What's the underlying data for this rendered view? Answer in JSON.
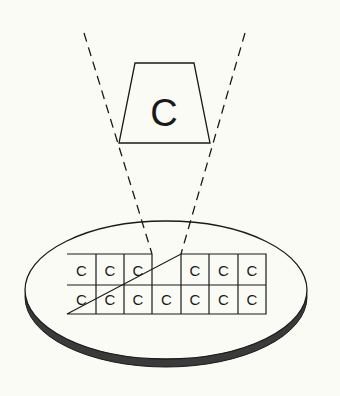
{
  "diagram": {
    "colors": {
      "background": "#fbfbf6",
      "stroke": "#1a1a1a",
      "plate_face": "#fbfbf6",
      "plate_edge": "#3a3a3a"
    },
    "picked_die": {
      "label": "C"
    },
    "grid": {
      "rows": 2,
      "cols": 7,
      "row_1": [
        "C",
        "C",
        "C",
        "",
        "C",
        "C",
        "C"
      ],
      "row_2": [
        "C",
        "C",
        "C",
        "C",
        "C",
        "C",
        "C"
      ],
      "empty_slot": {
        "row": 1,
        "col": 4
      }
    }
  }
}
